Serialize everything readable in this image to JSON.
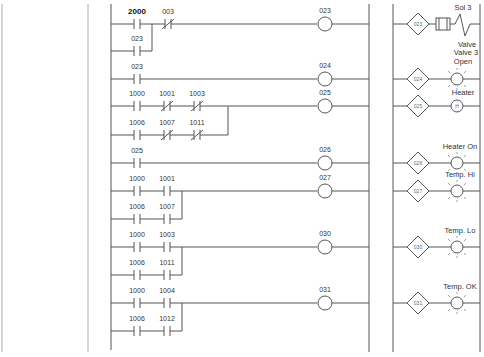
{
  "diagram": {
    "type": "ladder-logic",
    "rails": {
      "page_left_x": 2,
      "page_divider_x": 88,
      "left_rail_x": 111,
      "right_rail_x": 369,
      "output_rail_left_x": 393,
      "output_rail_right_x": 480
    },
    "colors": {
      "line": "#555555",
      "faint_line": "#aaaaaa",
      "text": "#333333",
      "background": "#ffffff"
    },
    "rungs": [
      {
        "y": 24,
        "coil": "023",
        "contacts": [
          {
            "label": "2000",
            "type": "NO",
            "x": 137,
            "bold": true
          },
          {
            "label": "003",
            "type": "NC",
            "x": 168
          }
        ],
        "branches": [
          {
            "y": 51,
            "join_x": 152,
            "contacts": [
              {
                "label": "023",
                "type": "NO",
                "x": 137
              }
            ]
          }
        ],
        "output": {
          "address": "023",
          "device": "solenoid",
          "label_top": "Sol 3",
          "label_bottom": "Valve"
        }
      },
      {
        "y": 79,
        "coil": "024",
        "contacts": [
          {
            "label": "023",
            "type": "NO",
            "x": 137
          }
        ],
        "branches": [],
        "output": {
          "address": "024",
          "device": "lamp",
          "label_top": "Valve 3",
          "label_top2": "Open"
        }
      },
      {
        "y": 106,
        "coil": "025",
        "contacts": [
          {
            "label": "1000",
            "type": "NO",
            "x": 137
          },
          {
            "label": "1001",
            "type": "NC",
            "x": 167
          },
          {
            "label": "1003",
            "type": "NC",
            "x": 197
          }
        ],
        "branches": [
          {
            "y": 135,
            "join_x": 228,
            "contacts": [
              {
                "label": "1006",
                "type": "NO",
                "x": 137
              },
              {
                "label": "1007",
                "type": "NC",
                "x": 167
              },
              {
                "label": "1011",
                "type": "NC",
                "x": 197
              }
            ]
          }
        ],
        "output": {
          "address": "025",
          "device": "heater",
          "label_top": "Heater",
          "glyph": "H"
        }
      },
      {
        "y": 163,
        "coil": "026",
        "contacts": [
          {
            "label": "025",
            "type": "NO",
            "x": 137
          }
        ],
        "branches": [],
        "output": {
          "address": "026",
          "device": "lamp",
          "label_top": "Heater On"
        }
      },
      {
        "y": 191,
        "coil": "027",
        "contacts": [
          {
            "label": "1000",
            "type": "NO",
            "x": 137
          },
          {
            "label": "1001",
            "type": "NO",
            "x": 167
          }
        ],
        "branches": [
          {
            "y": 219,
            "join_x": 182,
            "contacts": [
              {
                "label": "1006",
                "type": "NO",
                "x": 137
              },
              {
                "label": "1007",
                "type": "NO",
                "x": 167
              }
            ]
          }
        ],
        "output": {
          "address": "027",
          "device": "lamp",
          "label_top": "Temp. Hi"
        }
      },
      {
        "y": 247,
        "coil": "030",
        "contacts": [
          {
            "label": "1000",
            "type": "NO",
            "x": 137
          },
          {
            "label": "1003",
            "type": "NO",
            "x": 167
          }
        ],
        "branches": [
          {
            "y": 275,
            "join_x": 182,
            "contacts": [
              {
                "label": "1006",
                "type": "NO",
                "x": 137
              },
              {
                "label": "1011",
                "type": "NO",
                "x": 167
              }
            ]
          }
        ],
        "output": {
          "address": "030",
          "device": "lamp",
          "label_top": "Temp. Lo"
        }
      },
      {
        "y": 303,
        "coil": "031",
        "contacts": [
          {
            "label": "1000",
            "type": "NO",
            "x": 137
          },
          {
            "label": "1004",
            "type": "NO",
            "x": 167
          }
        ],
        "branches": [
          {
            "y": 331,
            "join_x": 182,
            "contacts": [
              {
                "label": "1006",
                "type": "NO",
                "x": 137
              },
              {
                "label": "1012",
                "type": "NO",
                "x": 167
              }
            ]
          }
        ],
        "output": {
          "address": "031",
          "device": "lamp",
          "label_top": "Temp. OK"
        }
      }
    ],
    "coil_x": 325,
    "output_diamond_x": 418,
    "output_device_x": 457
  }
}
